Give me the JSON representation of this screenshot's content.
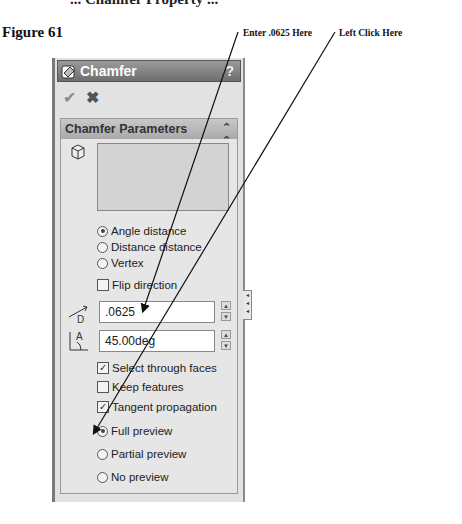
{
  "document": {
    "top_cut_text": "... Chamfer Property ...",
    "figure_label": "Figure 61",
    "callouts": [
      {
        "text": "Enter .0625 Here"
      },
      {
        "text": "Left Click Here"
      }
    ]
  },
  "panel": {
    "title": "Chamfer",
    "help_label": "?",
    "ok_label": "✔",
    "cancel_label": "✖",
    "group": {
      "header": "Chamfer Parameters",
      "collapse_glyph": "⌃",
      "type_options": [
        {
          "label": "Angle distance",
          "selected": true
        },
        {
          "label": "Distance distance",
          "selected": false
        },
        {
          "label": "Vertex",
          "selected": false
        }
      ],
      "flip_direction": {
        "label": "Flip direction",
        "checked": false
      },
      "distance": {
        "value": ".0625",
        "icon": "distance-dimension-icon",
        "icon_label": "D"
      },
      "angle": {
        "value": "45.00deg",
        "icon": "angle-dimension-icon",
        "icon_label": "A"
      },
      "checks": [
        {
          "label": "Select through faces",
          "checked": true
        },
        {
          "label": "Keep features",
          "checked": false
        },
        {
          "label": "Tangent propagation",
          "checked": true
        }
      ],
      "preview_options": [
        {
          "label": "Full preview",
          "selected": true
        },
        {
          "label": "Partial preview",
          "selected": false
        },
        {
          "label": "No preview",
          "selected": false
        }
      ],
      "spin_up": "▲",
      "spin_down": "▼"
    },
    "side_tab_glyph": "◂◂◂"
  }
}
